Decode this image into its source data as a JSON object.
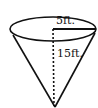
{
  "diagram": {
    "shape": "cone",
    "orientation": "inverted",
    "labels": {
      "radius": "5ft.",
      "height": "15ft."
    },
    "colors": {
      "stroke": "#111111",
      "background": "#ffffff"
    }
  }
}
